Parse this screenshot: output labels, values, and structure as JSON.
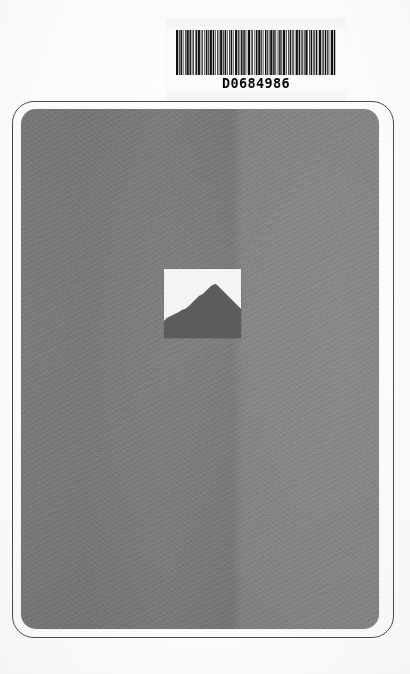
{
  "document": {
    "kind": "scanned-book-back-cover",
    "barcode_label": {
      "number": "D0684986",
      "symbology_name": "barcode-bars",
      "bar_widths": [
        3,
        1,
        2,
        1,
        1,
        3,
        2,
        1,
        1,
        2,
        3,
        1,
        1,
        1,
        2,
        1,
        3,
        2,
        1,
        1,
        1,
        3,
        1,
        2,
        1,
        1,
        2,
        1,
        3,
        1,
        1,
        2,
        2,
        1,
        3,
        1,
        1,
        1,
        2,
        3,
        1,
        1,
        2,
        1,
        1,
        3,
        2,
        1,
        1,
        2,
        1,
        3,
        1,
        1,
        2,
        1,
        1,
        3,
        2,
        1,
        1,
        1,
        3,
        1,
        2,
        1,
        1,
        2,
        3,
        1,
        1,
        2,
        1,
        1,
        3,
        2
      ],
      "bar_gaps": [
        1,
        1,
        1,
        2,
        1,
        1,
        1,
        1,
        2,
        1,
        1,
        1,
        2,
        1,
        1,
        1,
        1,
        1,
        2,
        1,
        1,
        1,
        1,
        1,
        2,
        1,
        1,
        2,
        1,
        1,
        1,
        1,
        1,
        2,
        1,
        1,
        2,
        1,
        1,
        1,
        1,
        2,
        1,
        1,
        1,
        1,
        1,
        2,
        1,
        1,
        1,
        1,
        2,
        1,
        1,
        1,
        2,
        1,
        1,
        1,
        1,
        1,
        2,
        1,
        1,
        1,
        1,
        2,
        1,
        1,
        1,
        1,
        1,
        2,
        1,
        1
      ]
    },
    "cover": {
      "body_color": "#7d7d7d",
      "body_color_right": "#8a8a8a",
      "outline_color": "#4a4a4a",
      "photo": {
        "name": "mountain-ridge-silhouette",
        "background_color": "#f4f4f2",
        "silhouette_color": "#4d4d4d",
        "ridge_points": "0,52 3,49 7,47 11,45 15,43 18,41 21,40 24,38 26,36 29,33 31,31 33,29 35,27 37,26 39,25 41,23 43,21 45,19 47,17 49,16 51,15 53,16 55,18 57,20 59,22 61,24 63,26 65,28 67,30 69,32 71,34 73,36 75,38 77,40 77,69 0,69"
      }
    },
    "page": {
      "background_color": "#fdfdfd"
    }
  }
}
